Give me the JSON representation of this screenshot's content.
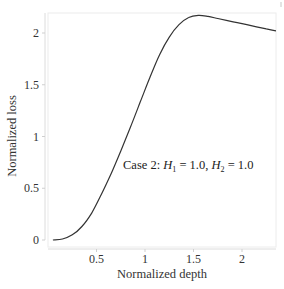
{
  "chart_data": {
    "type": "line",
    "title": "",
    "xlabel": "Normalized depth",
    "ylabel": "Normalized loss",
    "xlim": [
      0.0,
      2.35
    ],
    "ylim": [
      -0.05,
      2.19
    ],
    "xticks": [
      0.5,
      1,
      1.5,
      2
    ],
    "xtick_labels": [
      "0.5",
      "1",
      "1.5",
      "2"
    ],
    "yticks": [
      0,
      0.5,
      1,
      1.5,
      2
    ],
    "ytick_labels": [
      "0",
      "0.5",
      "1",
      "1.5",
      "2"
    ],
    "grid": false,
    "legend": null,
    "annotation": {
      "text": "Case 2: H1 = 1.0, H2 = 1.0",
      "prefix": "Case 2: ",
      "h1_symbol": "H",
      "h1_sub": "1",
      "h1_value": " = 1.0, ",
      "h2_symbol": "H",
      "h2_sub": "2",
      "h2_value": " = 1.0",
      "x": 0.78,
      "y": 0.75
    },
    "series": [
      {
        "name": "Case 2",
        "color": "#333333",
        "x": [
          0.05,
          0.15,
          0.25,
          0.35,
          0.45,
          0.55,
          0.65,
          0.75,
          0.85,
          0.95,
          1.05,
          1.15,
          1.25,
          1.35,
          1.45,
          1.55,
          1.65,
          1.75,
          1.85,
          1.95,
          2.05,
          2.15,
          2.25,
          2.35
        ],
        "y": [
          0.0,
          0.01,
          0.05,
          0.13,
          0.26,
          0.44,
          0.64,
          0.86,
          1.09,
          1.33,
          1.57,
          1.79,
          1.96,
          2.08,
          2.15,
          2.17,
          2.16,
          2.14,
          2.12,
          2.1,
          2.08,
          2.06,
          2.04,
          2.02
        ]
      }
    ]
  },
  "figure": {
    "frame_color": "#e6e6e6",
    "axis_color": "#d9d9d9",
    "line_color": "#333333"
  }
}
